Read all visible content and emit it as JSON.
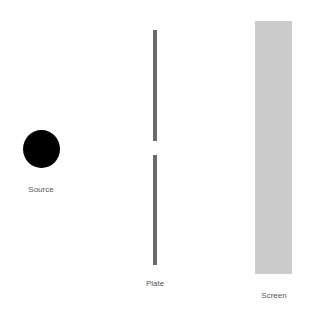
{
  "diagram": {
    "source": {
      "label": "Source",
      "color": "#000000"
    },
    "plate": {
      "label": "Plate",
      "color": "#6b6b6b"
    },
    "screen": {
      "label": "Screen",
      "color": "#cccccc"
    }
  }
}
